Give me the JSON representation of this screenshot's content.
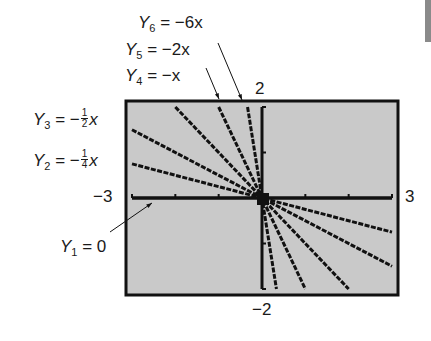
{
  "chart_data": {
    "type": "line",
    "title": "",
    "xlabel": "",
    "ylabel": "",
    "xlim": [
      -3,
      3
    ],
    "ylim": [
      -2,
      2
    ],
    "grid": false,
    "window_labels": {
      "xmin": "−3",
      "xmax": "3",
      "ymin": "−2",
      "ymax": "2"
    },
    "series": [
      {
        "name": "Y1",
        "label_var": "Y",
        "label_sub": "1",
        "label_rhs": "= 0",
        "slope": 0
      },
      {
        "name": "Y2",
        "label_var": "Y",
        "label_sub": "2",
        "label_rhs_pre": "= −",
        "frac_num": "1",
        "frac_den": "4",
        "label_rhs_post": "x",
        "slope": -0.25
      },
      {
        "name": "Y3",
        "label_var": "Y",
        "label_sub": "3",
        "label_rhs_pre": "= −",
        "frac_num": "1",
        "frac_den": "2",
        "label_rhs_post": "x",
        "slope": -0.5
      },
      {
        "name": "Y4",
        "label_var": "Y",
        "label_sub": "4",
        "label_rhs": "= −x",
        "slope": -1
      },
      {
        "name": "Y5",
        "label_var": "Y",
        "label_sub": "5",
        "label_rhs": "= −2x",
        "slope": -2
      },
      {
        "name": "Y6",
        "label_var": "Y",
        "label_sub": "6",
        "label_rhs": "= −6x",
        "slope": -6
      }
    ],
    "annotations": [
      "Y6 = −6x",
      "Y5 = −2x",
      "Y4 = −x",
      "Y3 = −1/2 x",
      "Y2 = −1/4 x",
      "Y1 = 0"
    ]
  },
  "colors": {
    "screen_bg": "#c9c9c9",
    "line": "#111111",
    "frame": "#111111",
    "side_bar": "#8a8a8a"
  }
}
